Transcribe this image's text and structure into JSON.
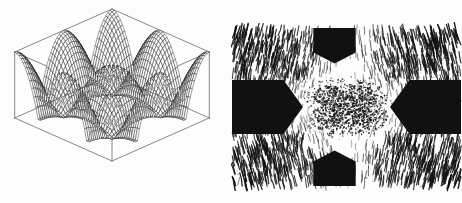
{
  "figure": {
    "title": "",
    "caption": "",
    "background_color": "#fdfdfd",
    "ink_color": "#111111",
    "panel_count": 2,
    "layout": "side-by-side"
  },
  "panels": [
    {
      "id": "surface",
      "name": "3d-wireframe-surface-plot",
      "label": "",
      "type": "surface3d",
      "render": "wireframe-mesh",
      "box": {
        "visible": true,
        "style": "thin-line-parallelepiped",
        "color": "#555555"
      },
      "axes_labels": {
        "x": "",
        "y": "",
        "z": ""
      },
      "tick_labels": [],
      "description_text": ""
    },
    {
      "id": "density",
      "name": "2d-density-contour-plot",
      "label": "",
      "type": "heatmap",
      "render": "stipple-hatch",
      "frame": {
        "visible": false
      },
      "axes_labels": {
        "x": "",
        "y": ""
      },
      "tick_labels": [],
      "description_text": ""
    }
  ],
  "chart_data": [
    {
      "type": "surface",
      "id": "surface",
      "title": "",
      "subtitle": "",
      "xlabel": "",
      "ylabel": "",
      "zlabel": "",
      "xlim": [
        -1,
        1
      ],
      "ylim": [
        -1,
        1
      ],
      "zlim": [
        0,
        1
      ],
      "grid": true,
      "legend": null,
      "legend_position": "none",
      "tick_labels": {
        "x": [],
        "y": [],
        "z": []
      },
      "render_style": "black wireframe mesh, hidden-line removed, white background",
      "projection": {
        "azimuth_deg": -45,
        "elevation_deg": 28
      },
      "mesh": {
        "nx": 46,
        "ny": 46
      },
      "formula": "z = cos(2*pi*x)*cos(2*pi*y) scaled to a four-peak egg-carton sheet with deep central and corner wells",
      "features": {
        "peaks": 4,
        "peak_positions": [
          [
            -0.5,
            -0.5
          ],
          [
            0.5,
            -0.5
          ],
          [
            -0.5,
            0.5
          ],
          [
            0.5,
            0.5
          ]
        ],
        "peak_height": 1.0,
        "wells": 5,
        "well_positions": [
          [
            0,
            0
          ],
          [
            -1,
            -1
          ],
          [
            1,
            -1
          ],
          [
            -1,
            1
          ],
          [
            1,
            1
          ]
        ],
        "well_depth": 0.0,
        "saddle_value": 0.45
      },
      "annotations": []
    },
    {
      "type": "heatmap",
      "id": "density",
      "title": "",
      "subtitle": "",
      "xlabel": "",
      "ylabel": "",
      "xlim": [
        -1,
        1
      ],
      "ylim": [
        -1,
        1
      ],
      "grid": false,
      "legend": null,
      "legend_position": "none",
      "tick_labels": {
        "x": [],
        "y": []
      },
      "colorscale": [
        "#ffffff",
        "#111111"
      ],
      "zlim": [
        0,
        1
      ],
      "render_style": "bilevel stipple / dithered halftone, saturated black lobes",
      "nx": 64,
      "ny": 64,
      "formula": "intensity = |cos(2*pi*x)*cos(2*pi*y)| thresholded and dithered; four saturated lobes on the axes, hatched density in the diagonal quadrants, X-shaped speckle at the origin",
      "features": {
        "saturated_regions": 4,
        "saturated_region_positions": [
          "top",
          "bottom",
          "left",
          "right"
        ],
        "saturated_region_shape": "pentagon",
        "hatched_quadrants": 4,
        "hatched_quadrant_positions": [
          "top-left",
          "top-right",
          "bottom-left",
          "bottom-right"
        ],
        "center_cluster_shape": "x-star",
        "center_cluster_density": 0.55
      },
      "annotations": []
    }
  ]
}
